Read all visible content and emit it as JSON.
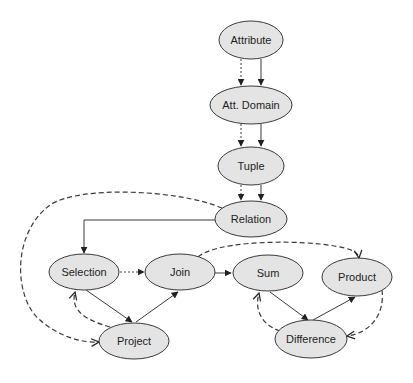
{
  "diagram": {
    "nodes": [
      {
        "id": "attribute",
        "label": "Attribute"
      },
      {
        "id": "att_domain",
        "label": "Att. Domain"
      },
      {
        "id": "tuple",
        "label": "Tuple"
      },
      {
        "id": "relation",
        "label": "Relation"
      },
      {
        "id": "selection",
        "label": "Selection"
      },
      {
        "id": "join",
        "label": "Join"
      },
      {
        "id": "sum",
        "label": "Sum"
      },
      {
        "id": "product",
        "label": "Product"
      },
      {
        "id": "project",
        "label": "Project"
      },
      {
        "id": "difference",
        "label": "Difference"
      }
    ],
    "edges": [
      {
        "from": "attribute",
        "to": "att_domain",
        "style": "dotted"
      },
      {
        "from": "attribute",
        "to": "att_domain",
        "style": "solid"
      },
      {
        "from": "att_domain",
        "to": "tuple",
        "style": "dotted"
      },
      {
        "from": "att_domain",
        "to": "tuple",
        "style": "solid"
      },
      {
        "from": "tuple",
        "to": "relation",
        "style": "dotted"
      },
      {
        "from": "tuple",
        "to": "relation",
        "style": "solid"
      },
      {
        "from": "relation",
        "to": "selection",
        "style": "solid"
      },
      {
        "from": "relation",
        "to": "project",
        "style": "dashed"
      },
      {
        "from": "selection",
        "to": "join",
        "style": "dotted"
      },
      {
        "from": "selection",
        "to": "project",
        "style": "solid"
      },
      {
        "from": "project",
        "to": "join",
        "style": "solid"
      },
      {
        "from": "project",
        "to": "selection",
        "style": "dashed"
      },
      {
        "from": "join",
        "to": "sum",
        "style": "solid"
      },
      {
        "from": "join",
        "to": "product",
        "style": "dashed"
      },
      {
        "from": "sum",
        "to": "difference",
        "style": "solid"
      },
      {
        "from": "difference",
        "to": "product",
        "style": "solid"
      },
      {
        "from": "difference",
        "to": "sum",
        "style": "dashed"
      },
      {
        "from": "product",
        "to": "difference",
        "style": "dashed"
      }
    ]
  }
}
